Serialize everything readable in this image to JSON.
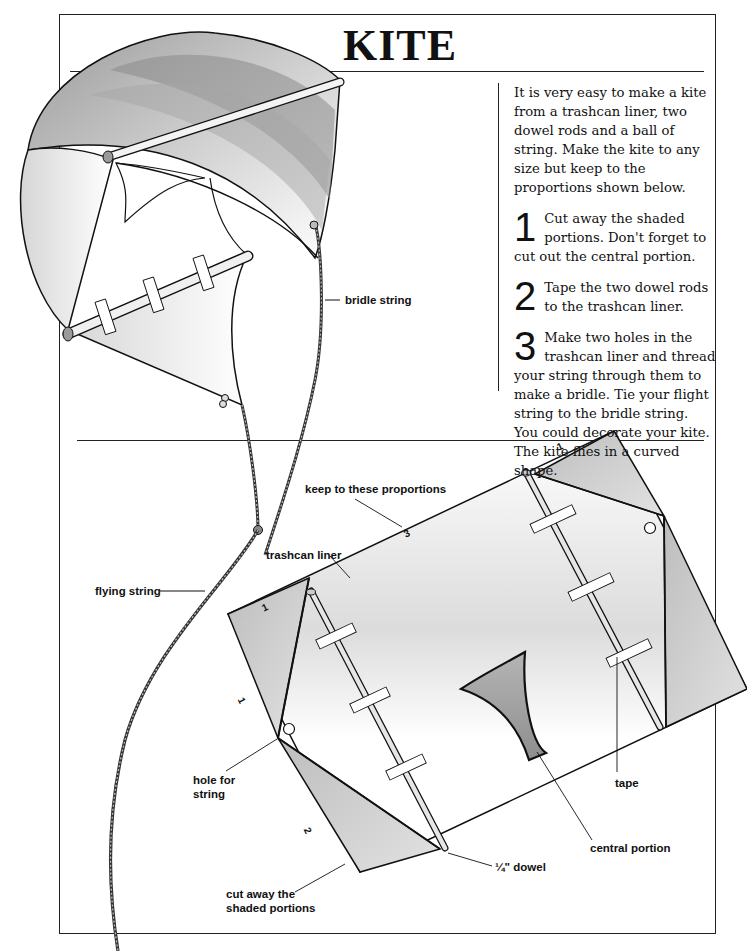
{
  "page": {
    "title": "KITE",
    "intro": "It is very easy to make a kite from a trashcan liner, two dowel rods and a ball of string. Make the kite to any size but keep to the proportions shown below.",
    "steps": [
      {
        "number": "1",
        "text": "Cut away the shaded portions. Don't forget to cut out the central portion."
      },
      {
        "number": "2",
        "text": "Tape the two dowel rods to the trashcan liner."
      },
      {
        "number": "3",
        "text": "Make two holes in the trashcan liner and thread your string through them to make a bridle. Tie your flight string to the bridle string. You could decorate your kite. The kite flies in a curved shape."
      }
    ]
  },
  "kite_illustration": {
    "labels": {
      "bridle_string": "bridle string",
      "flying_string": "flying string"
    }
  },
  "plan_diagram": {
    "labels": {
      "keep_proportions": "keep to these proportions",
      "trashcan_liner": "trashcan liner",
      "hole_for_string_line1": "hole for",
      "hole_for_string_line2": "string",
      "cut_away_line1": "cut away the",
      "cut_away_line2": "shaded portions",
      "dowel": "¼\" dowel",
      "central_portion": "central portion",
      "tape": "tape"
    },
    "proportions": {
      "long_side": "3",
      "short_side_top_left": "1",
      "short_side_left": "1",
      "short_side_top_right": "1",
      "bottom_left": "2"
    },
    "colors": {
      "shaded": "#c8c8c8",
      "central": "#a9a9a9",
      "outline": "#111111"
    }
  }
}
